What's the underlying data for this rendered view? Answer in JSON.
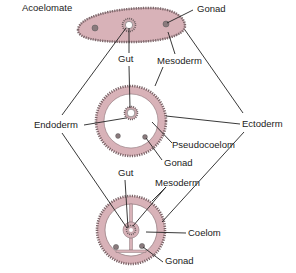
{
  "colors": {
    "mesoderm": "#d8b2b8",
    "ectoderm_border": "#8c7478",
    "gonad": "#8a7a7d",
    "line": "#222222",
    "background": "#ffffff"
  },
  "labels": {
    "acoelomate": "Acoelomate",
    "gonad_top": "Gonad",
    "gut_top": "Gut",
    "mesoderm_top": "Mesoderm",
    "endoderm": "Endoderm",
    "ectoderm": "Ectoderm",
    "pseudocoelom": "Pseudocoelom",
    "gonad_middle": "Gonad",
    "gut_bottom": "Gut",
    "mesoderm_bottom": "Mesoderm",
    "coelom": "Coelom",
    "gonad_bottom": "Gonad"
  },
  "diagrams": [
    {
      "name": "acoelomate",
      "shape": "ellipse-elongated"
    },
    {
      "name": "pseudocoelomate",
      "shape": "circle"
    },
    {
      "name": "coelomate",
      "shape": "circle"
    }
  ]
}
